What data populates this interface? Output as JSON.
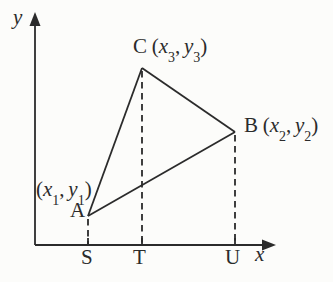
{
  "diagram": {
    "colors": {
      "ink": "#2b2b2b",
      "background": "#fcfcfa"
    },
    "axes": {
      "x_label": "x",
      "y_label": "y"
    },
    "vertices": {
      "A": {
        "letter": "A",
        "coord": {
          "open": "(",
          "x": "x",
          "xsub": "1",
          "comma": ",",
          "y": "y",
          "ysub": "1",
          "close": ")"
        }
      },
      "B": {
        "letter": "B",
        "coord": {
          "open": "(",
          "x": "x",
          "xsub": "2",
          "comma": ",",
          "y": "y",
          "ysub": "2",
          "close": ")"
        }
      },
      "C": {
        "letter": "C",
        "coord": {
          "open": "(",
          "x": "x",
          "xsub": "3",
          "comma": ",",
          "y": "y",
          "ysub": "3",
          "close": ")"
        }
      }
    },
    "feet": {
      "S": "S",
      "T": "T",
      "U": "U"
    }
  }
}
